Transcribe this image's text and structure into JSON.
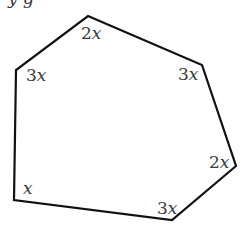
{
  "diagram": {
    "type": "polygon",
    "shape": "hexagon",
    "stroke_color": "#111111",
    "label_color": "#3a3a3a",
    "top_fragment": "y g",
    "vertices": [
      {
        "id": "top",
        "x": 88,
        "y": 16,
        "coef": "2",
        "var": "x",
        "label_x": 81,
        "label_y": 39
      },
      {
        "id": "upper-right",
        "x": 202,
        "y": 65,
        "coef": "3",
        "var": "x",
        "label_x": 178,
        "label_y": 80
      },
      {
        "id": "right",
        "x": 236,
        "y": 166,
        "coef": "2",
        "var": "x",
        "label_x": 209,
        "label_y": 168
      },
      {
        "id": "bottom-right",
        "x": 172,
        "y": 220,
        "coef": "3",
        "var": "x",
        "label_x": 157,
        "label_y": 214
      },
      {
        "id": "bottom-left",
        "x": 14,
        "y": 200,
        "coef": "",
        "var": "x",
        "label_x": 23,
        "label_y": 194
      },
      {
        "id": "upper-left",
        "x": 16,
        "y": 70,
        "coef": "3",
        "var": "x",
        "label_x": 26,
        "label_y": 81
      }
    ]
  }
}
